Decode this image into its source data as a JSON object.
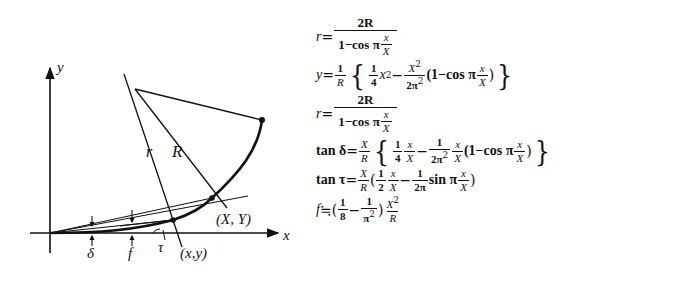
{
  "diagram": {
    "axes": {
      "x_label": "x",
      "y_label": "y"
    },
    "labels": {
      "r": "r",
      "R": "R",
      "end_point": "(X, Y)",
      "point": "(x,y)",
      "delta": "δ",
      "f": "f",
      "tau": "τ"
    }
  },
  "formulas": [
    {
      "id": "r1",
      "text": "r = 2R / (1 − cos π x/X)",
      "lhs": "r",
      "num": "2R",
      "den_a": "1−cos π",
      "den_fn": "x",
      "den_fd": "X"
    },
    {
      "id": "y",
      "text": "y = 1/R { 1/4 x² − X²/(2π²) (1 − cos π x/X) }",
      "lhs": "y",
      "c_num": "1",
      "c_den": "R",
      "t1_num": "1",
      "t1_den": "4",
      "t1_var": "x",
      "t1_exp": "2",
      "t2_num": "X",
      "t2_exp": "2",
      "t2_den": "2π",
      "t2_den_exp": "2",
      "paren_a": "(1−cos π",
      "paren_fn": "x",
      "paren_fd": "X",
      "paren_b": ")"
    },
    {
      "id": "r2",
      "text": "r = 2R / (1 − cos π x/X)",
      "lhs": "r",
      "num": "2R",
      "den_a": "1−cos π",
      "den_fn": "x",
      "den_fd": "X"
    },
    {
      "id": "tan_delta",
      "text": "tan δ = X/R { 1/4 x/X − 1/(2π²) x/X (1 − cos π x/X) }",
      "lhs": "tan δ",
      "c_num": "X",
      "c_den": "R",
      "t1_num": "1",
      "t1_den": "4",
      "t1b_num": "x",
      "t1b_den": "X",
      "t2_num": "1",
      "t2_den": "2π",
      "t2_den_exp": "2",
      "t2b_num": "x",
      "t2b_den": "X",
      "paren_a": "(1−cos π",
      "paren_fn": "x",
      "paren_fd": "X",
      "paren_b": ")"
    },
    {
      "id": "tan_tau",
      "text": "tan τ = X/R (1/2 x/X − 1/(2π) sin π x/X)",
      "lhs": "tan τ",
      "c_num": "X",
      "c_den": "R",
      "t1_num": "1",
      "t1_den": "2",
      "t1b_num": "x",
      "t1b_den": "X",
      "t2_num": "1",
      "t2_den": "2π",
      "sin": "sin π",
      "s_num": "x",
      "s_den": "X"
    },
    {
      "id": "f",
      "text": "f ≒ (1/8 − 1/π²) X²/R",
      "lhs": "f",
      "approx": "≒",
      "t1_num": "1",
      "t1_den": "8",
      "t2_num": "1",
      "t2_den": "π",
      "t2_den_exp": "2",
      "c_num": "X",
      "c_exp": "2",
      "c_den": "R"
    }
  ]
}
